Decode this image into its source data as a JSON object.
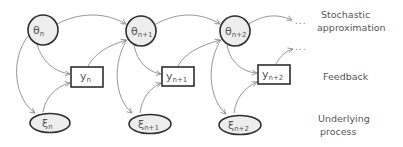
{
  "diagram": {
    "type": "stochastic-process-graphical-model",
    "colors": {
      "node_fill": "#ededed",
      "node_stroke": "#2e2e2e",
      "edge": "#8a8a8a",
      "text": "#555555"
    },
    "theta_nodes": [
      {
        "symbol": "θ",
        "subscript": "n"
      },
      {
        "symbol": "θ",
        "subscript": "n+1"
      },
      {
        "symbol": "θ",
        "subscript": "n+2"
      }
    ],
    "y_nodes": [
      {
        "symbol": "y",
        "subscript": "n"
      },
      {
        "symbol": "y",
        "subscript": "n+1"
      },
      {
        "symbol": "y",
        "subscript": "n+2"
      }
    ],
    "xi_nodes": [
      {
        "symbol": "ξ",
        "subscript": "n"
      },
      {
        "symbol": "ξ",
        "subscript": "n+1"
      },
      {
        "symbol": "ξ",
        "subscript": "n+2"
      }
    ],
    "continuation": {
      "top": "...",
      "middle": "..."
    },
    "row_labels": {
      "stochastic_line1": "Stochastic",
      "stochastic_line2": "approximation",
      "feedback": "Feedback",
      "underlying_line1": "Underlying",
      "underlying_line2": "process"
    },
    "edges": [
      "θn → θn+1",
      "θn → yn",
      "θn → ξn",
      "ξn → yn",
      "yn → θn+1",
      "θn+1 → θn+2",
      "θn+1 → yn+1",
      "θn+1 → ξn+1",
      "ξn+1 → yn+1",
      "yn+1 → θn+2",
      "θn+2 → ...",
      "θn+2 → yn+2",
      "θn+2 → ξn+2",
      "ξn+2 → yn+2",
      "yn+2 → ..."
    ]
  }
}
